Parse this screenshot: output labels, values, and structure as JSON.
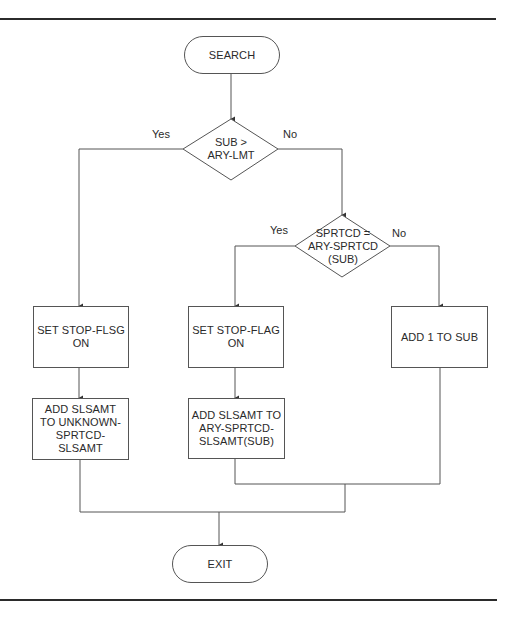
{
  "diagram": {
    "type": "flowchart",
    "nodes": {
      "search": {
        "shape": "terminal",
        "label": "SEARCH"
      },
      "decision_sub_limit": {
        "shape": "decision",
        "label": "SUB >\nARY-LMT"
      },
      "decision_sprtcd": {
        "shape": "decision",
        "label": "SPRTCD =\nARY-SPRTCD\n(SUB)"
      },
      "set_stop_flsg": {
        "shape": "process",
        "label": "SET STOP-FLSG\nON"
      },
      "set_stop_flag": {
        "shape": "process",
        "label": "SET STOP-FLAG\nON"
      },
      "add_one_to_sub": {
        "shape": "process",
        "label": "ADD 1 TO SUB"
      },
      "add_slsamt_unknown": {
        "shape": "process",
        "label": "ADD SLSAMT\nTO UNKNOWN-\nSPRTCD-\nSLSAMT"
      },
      "add_slsamt_ary": {
        "shape": "process",
        "label": "ADD SLSAMT TO\nARY-SPRTCD-\nSLSAMT(SUB)"
      },
      "exit": {
        "shape": "terminal",
        "label": "EXIT"
      }
    },
    "edge_labels": {
      "d1_yes": "Yes",
      "d1_no": "No",
      "d2_yes": "Yes",
      "d2_no": "No"
    },
    "edges": [
      {
        "from": "SEARCH",
        "to": "SUB > ARY-LMT"
      },
      {
        "from": "SUB > ARY-LMT",
        "to": "SET STOP-FLSG ON",
        "label": "Yes"
      },
      {
        "from": "SUB > ARY-LMT",
        "to": "SPRTCD = ARY-SPRTCD (SUB)",
        "label": "No"
      },
      {
        "from": "SPRTCD = ARY-SPRTCD (SUB)",
        "to": "SET STOP-FLAG ON",
        "label": "Yes"
      },
      {
        "from": "SPRTCD = ARY-SPRTCD (SUB)",
        "to": "ADD 1 TO SUB",
        "label": "No"
      },
      {
        "from": "SET STOP-FLSG ON",
        "to": "ADD SLSAMT TO UNKNOWN-SPRTCD-SLSAMT"
      },
      {
        "from": "SET STOP-FLAG ON",
        "to": "ADD SLSAMT TO ARY-SPRTCD-SLSAMT(SUB)"
      },
      {
        "from": "ADD SLSAMT TO UNKNOWN-SPRTCD-SLSAMT",
        "to": "EXIT"
      },
      {
        "from": "ADD SLSAMT TO ARY-SPRTCD-SLSAMT(SUB)",
        "to": "EXIT"
      },
      {
        "from": "ADD 1 TO SUB",
        "to": "EXIT"
      }
    ],
    "colors": {
      "line": "#555555",
      "rule": "#2b2b2b",
      "text": "#2a2a2a",
      "background": "#ffffff"
    }
  }
}
